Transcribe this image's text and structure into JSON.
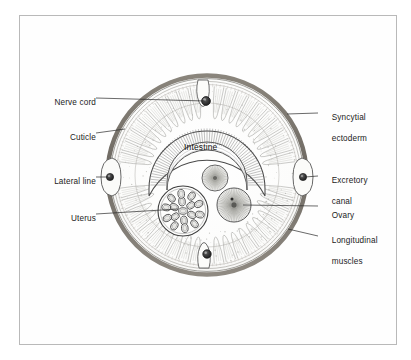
{
  "figure": {
    "frame": {
      "border_color": "#b9b9b9"
    },
    "colors": {
      "cuticle": "#6f6a63",
      "ink": "#3a3a3a",
      "fill": "#fbfbfa",
      "muscle": "#9b9b96",
      "label_text": "#1b1b1b",
      "leader_line": "#2a2a2a"
    },
    "center_label": "Intestine",
    "labels_left": [
      {
        "id": "nerve-cord",
        "text": "Nerve cord",
        "x": 42,
        "y": 93,
        "line_x1": 96,
        "line_y1": 98,
        "line_x2": 205,
        "line_y2": 101
      },
      {
        "id": "cuticle",
        "text": "Cuticle",
        "x": 58,
        "y": 128,
        "line_x1": 96,
        "line_y1": 133,
        "line_x2": 125,
        "line_y2": 129
      },
      {
        "id": "lateral-line",
        "text": "Lateral line",
        "x": 35,
        "y": 172,
        "line_x1": 96,
        "line_y1": 177,
        "line_x2": 108,
        "line_y2": 177
      },
      {
        "id": "uterus",
        "text": "Uterus",
        "x": 60,
        "y": 209,
        "line_x1": 96,
        "line_y1": 214,
        "line_x2": 178,
        "line_y2": 209
      }
    ],
    "labels_right": [
      {
        "id": "syncytial-ectoderm",
        "line1": "Syncytial",
        "line2": "ectoderm",
        "x": 326,
        "y": 108,
        "line_x1": 318,
        "line_y1": 113,
        "line_x2": 287,
        "line_y2": 114
      },
      {
        "id": "excretory-canal",
        "line1": "Excretory",
        "line2": "canal",
        "x": 326,
        "y": 171,
        "line_x1": 318,
        "line_y1": 176,
        "line_x2": 305,
        "line_y2": 177
      },
      {
        "id": "ovary",
        "line1": "Ovary",
        "line2": "",
        "x": 326,
        "y": 202,
        "line_x1": 318,
        "line_y1": 206,
        "line_x2": 243,
        "line_y2": 205
      },
      {
        "id": "longitudinal-muscles",
        "line1": "Longitudinal",
        "line2": "muscles",
        "x": 326,
        "y": 231,
        "line_x1": 318,
        "line_y1": 236,
        "line_x2": 288,
        "line_y2": 229
      }
    ],
    "structures": {
      "body_circle": {
        "cx": 207,
        "cy": 175,
        "r": 101
      },
      "cuticle_ring_width": 4,
      "dorsal_nerve_cord": {
        "cx": 206,
        "cy": 101,
        "r": 4.2
      },
      "ventral_nerve_cord": {
        "cx": 207,
        "cy": 254,
        "r": 4.2
      },
      "lateral_line_left": {
        "cx": 110,
        "cy": 177,
        "r": 3.6
      },
      "excretory_canal_right": {
        "cx": 303,
        "cy": 177,
        "r": 3.6
      },
      "uterus": {
        "cx": 183,
        "cy": 211,
        "r": 25,
        "egg_count": 17
      },
      "ovary_lower": {
        "cx": 234,
        "cy": 205,
        "r": 17
      },
      "ovary_upper": {
        "cx": 215,
        "cy": 178,
        "r": 13
      },
      "intestine_arc": {
        "cx": 207,
        "cy": 185,
        "outer_r": 58,
        "inner_r": 40
      }
    }
  }
}
